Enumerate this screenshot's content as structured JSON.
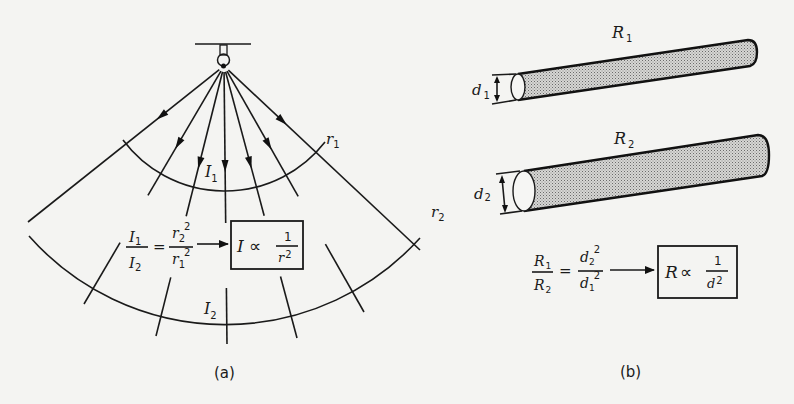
{
  "panel_a": {
    "caption": "(a)",
    "labels": {
      "r1": "r",
      "r1_sub": "1",
      "r2": "r",
      "r2_sub": "2",
      "I1": "I",
      "I1_sub": "1",
      "I2": "I",
      "I2_sub": "2"
    },
    "equation": {
      "lhs_num": "I",
      "lhs_num_sub": "1",
      "lhs_den": "I",
      "lhs_den_sub": "2",
      "equals": "=",
      "rhs_num": "r",
      "rhs_num_sub": "2",
      "rhs_num_sup": "2",
      "rhs_den": "r",
      "rhs_den_sub": "1",
      "rhs_den_sup": "2"
    },
    "result_box": {
      "var": "I",
      "prop": "∝",
      "num": "1",
      "den": "r",
      "den_sup": "2"
    }
  },
  "panel_b": {
    "caption": "(b)",
    "labels": {
      "R1": "R",
      "R1_sub": "1",
      "R2": "R",
      "R2_sub": "2",
      "d1": "d",
      "d1_sub": "1",
      "d2": "d",
      "d2_sub": "2"
    },
    "equation": {
      "lhs_num": "R",
      "lhs_num_sub": "1",
      "lhs_den": "R",
      "lhs_den_sub": "2",
      "equals": "=",
      "rhs_num": "d",
      "rhs_num_sub": "2",
      "rhs_num_sup": "2",
      "rhs_den": "d",
      "rhs_den_sub": "1",
      "rhs_den_sup": "2"
    },
    "result_box": {
      "var": "R",
      "prop": "∝",
      "num": "1",
      "den": "d",
      "den_sup": "2"
    }
  },
  "colors": {
    "background": "#f4f4f2",
    "ink": "#1a1a1a",
    "cylinder_fill": "#bdbdbd"
  }
}
